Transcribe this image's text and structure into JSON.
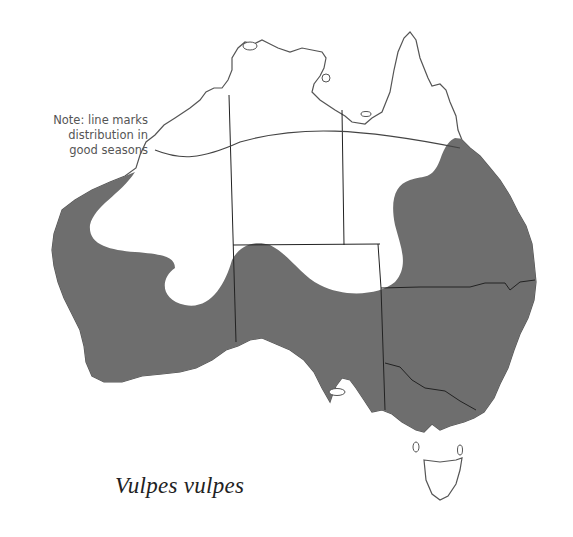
{
  "map": {
    "region": "Australia",
    "species": "Vulpes vulpes",
    "note": [
      "Note: line marks",
      "distribution in",
      "good seasons"
    ],
    "colors": {
      "distribution_fill": "#6e6e6e",
      "land_outline": "#555555",
      "border": "#222222",
      "background": "#ffffff"
    },
    "legend": {
      "shaded": "distribution",
      "line": "distribution in good seasons"
    }
  }
}
